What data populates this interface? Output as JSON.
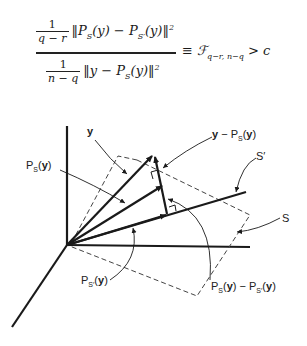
{
  "formula": {
    "numerator": {
      "coef_top": "1",
      "coef_bottom": "q − r",
      "expr": "‖P",
      "sub1": "S",
      "mid": "(y) − P",
      "sub2": "S′",
      "tail": "(y)‖",
      "power": "2"
    },
    "denominator": {
      "coef_top": "1",
      "coef_bottom": "n − q",
      "expr": "‖y − P",
      "sub1": "S",
      "tail": "(y)‖",
      "power": "2"
    },
    "rhs": {
      "equiv": "≡ ℱ",
      "sub": "q−r, n−q",
      "tail": "> c"
    }
  },
  "diagram": {
    "labels": {
      "y": "y",
      "y_minus_ps": "y − P",
      "y_minus_ps_sub": "S",
      "y_minus_ps_tail": "(y)",
      "ps": "P",
      "ps_sub": "S",
      "ps_tail": "(y)",
      "s_prime": "S′",
      "s": "S",
      "psp": "P",
      "psp_sub": "S′",
      "psp_tail": "(y)",
      "diff": "P",
      "diff_sub1": "S",
      "diff_mid": "(y) − P",
      "diff_sub2": "S′",
      "diff_tail": "(y)"
    },
    "colors": {
      "line": "#1a1a1a",
      "dashed": "#444444"
    }
  }
}
